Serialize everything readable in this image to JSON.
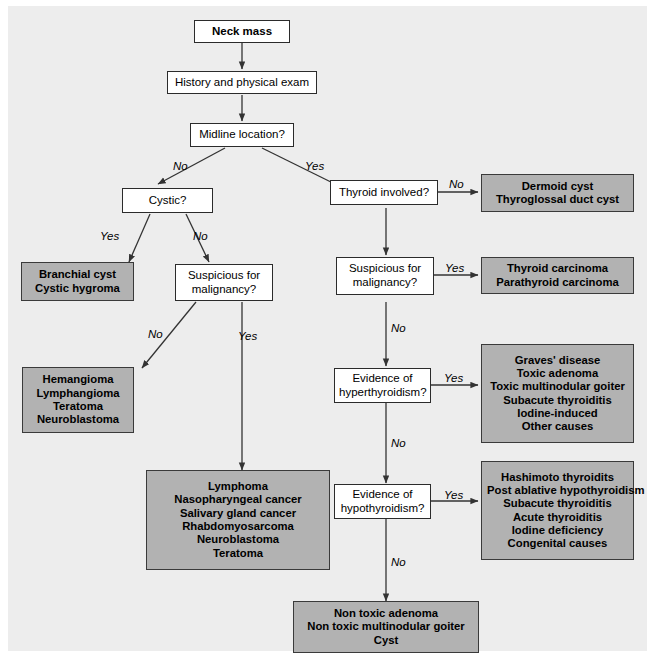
{
  "diagram": {
    "colors": {
      "panel_background": "#ededed",
      "page_background": "#ffffff",
      "decision_fill": "#ffffff",
      "outcome_fill": "#b2b2b2",
      "border": "#2b2b2b",
      "connector": "#333333"
    },
    "nodes": {
      "start": {
        "label": "Neck mass"
      },
      "history": {
        "label": "History and physical exam"
      },
      "midline": {
        "label": "Midline location?"
      },
      "cystic": {
        "label": "Cystic?"
      },
      "suspicious_left": {
        "line1": "Suspicious for",
        "line2": "malignancy?"
      },
      "thyroid_involved": {
        "label": "Thyroid involved?"
      },
      "suspicious_right": {
        "line1": "Suspicious for",
        "line2": "malignancy?"
      },
      "hyperthyroidism": {
        "line1": "Evidence of",
        "line2": "hyperthyroidism?"
      },
      "hypothyroidism": {
        "line1": "Evidence of",
        "line2": "hypothyroidism?"
      },
      "branchial": {
        "items": [
          "Branchial cyst",
          "Cystic hygroma"
        ]
      },
      "hemangioma": {
        "items": [
          "Hemangioma",
          "Lymphangioma",
          "Teratoma",
          "Neuroblastoma"
        ]
      },
      "lymphoma": {
        "items": [
          "Lymphoma",
          "Nasopharyngeal cancer",
          "Salivary gland cancer",
          "Rhabdomyosarcoma",
          "Neuroblastoma",
          "Teratoma"
        ]
      },
      "dermoid": {
        "items": [
          "Dermoid cyst",
          "Thyroglossal duct cyst"
        ]
      },
      "carcinoma": {
        "items": [
          "Thyroid carcinoma",
          "Parathyroid carcinoma"
        ]
      },
      "hyper_causes": {
        "items": [
          "Graves' disease",
          "Toxic adenoma",
          "Toxic multinodular goiter",
          "Subacute thyroiditis",
          "Iodine-induced",
          "Other causes"
        ]
      },
      "hypo_causes": {
        "items": [
          "Hashimoto thyroidits",
          "Post ablative hypothyroidism",
          "Subacute thyroiditis",
          "Acute thyroiditis",
          "Iodine deficiency",
          "Congenital causes"
        ]
      },
      "nontoxic": {
        "items": [
          "Non toxic adenoma",
          "Non toxic multinodular goiter",
          "Cyst"
        ]
      }
    },
    "edge_labels": {
      "midline_no": "No",
      "midline_yes": "Yes",
      "cystic_yes": "Yes",
      "cystic_no": "No",
      "susp_left_no": "No",
      "susp_left_yes": "Yes",
      "thyroid_no": "No",
      "susp_right_yes": "Yes",
      "susp_right_no": "No",
      "hyper_yes": "Yes",
      "hyper_no": "No",
      "hypo_yes": "Yes",
      "hypo_no": "No"
    }
  }
}
